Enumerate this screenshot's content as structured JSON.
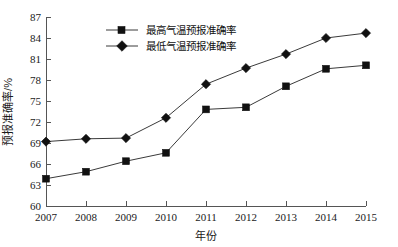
{
  "chart_data": {
    "type": "line",
    "title": "",
    "xlabel": "年份",
    "ylabel": "预报准确率/%",
    "categories": [
      "2007",
      "2008",
      "2009",
      "2010",
      "2011",
      "2012",
      "2013",
      "2014",
      "2015"
    ],
    "x": [
      2007,
      2008,
      2009,
      2010,
      2011,
      2012,
      2013,
      2014,
      2015
    ],
    "xlim": [
      2007,
      2015
    ],
    "ylim": [
      60,
      87
    ],
    "yticks": [
      60,
      63,
      66,
      69,
      72,
      75,
      78,
      81,
      84,
      87
    ],
    "ytick_labels": [
      "60",
      "63",
      "66",
      "69",
      "72",
      "75",
      "78",
      "81",
      "84",
      "87"
    ],
    "grid": false,
    "legend_position": "top-center",
    "series": [
      {
        "name": "最高气温预报准确率",
        "marker": "square",
        "color": "#111111",
        "values": [
          63.9,
          64.9,
          66.4,
          67.6,
          73.8,
          74.1,
          77.1,
          79.6,
          80.1
        ]
      },
      {
        "name": "最低气温预报准确率",
        "marker": "diamond",
        "color": "#111111",
        "values": [
          69.2,
          69.6,
          69.7,
          72.6,
          77.4,
          79.7,
          81.7,
          84.0,
          84.7
        ]
      }
    ]
  },
  "axes": {
    "y_axis_title": "预报准确率/%",
    "x_axis_title": "年份"
  },
  "legend": {
    "items": [
      {
        "label": "最高气温预报准确率",
        "marker": "square-marker-icon"
      },
      {
        "label": "最低气温预报准确率",
        "marker": "diamond-marker-icon"
      }
    ]
  },
  "colors": {
    "series_stroke": "#3a3a3a",
    "marker_fill": "#111111",
    "axis": "#555555",
    "background": "#ffffff"
  }
}
